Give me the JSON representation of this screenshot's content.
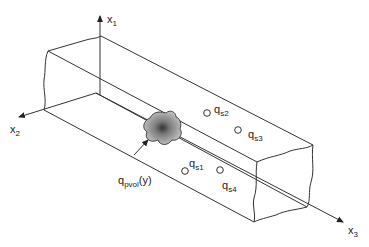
{
  "diagram": {
    "type": "3D rectangular bar with coordinate axes, point sources and volume source",
    "axes": [
      {
        "id": "x1",
        "label": "x",
        "sub": "1",
        "direction": "up"
      },
      {
        "id": "x2",
        "label": "x",
        "sub": "2",
        "direction": "left-down"
      },
      {
        "id": "x3",
        "label": "x",
        "sub": "3",
        "direction": "right-down"
      }
    ],
    "point_sources": [
      {
        "id": "qs1",
        "label": "q",
        "sub": "s1"
      },
      {
        "id": "qs2",
        "label": "q",
        "sub": "s2"
      },
      {
        "id": "qs3",
        "label": "q",
        "sub": "s3"
      },
      {
        "id": "qs4",
        "label": "q",
        "sub": "s4"
      }
    ],
    "volume_source": {
      "label": "q",
      "sub": "pvol",
      "arg": "(y)"
    },
    "colors": {
      "line": "#333333",
      "blob_edge": "#222222",
      "blob_fill": "#9a9a9a"
    }
  }
}
